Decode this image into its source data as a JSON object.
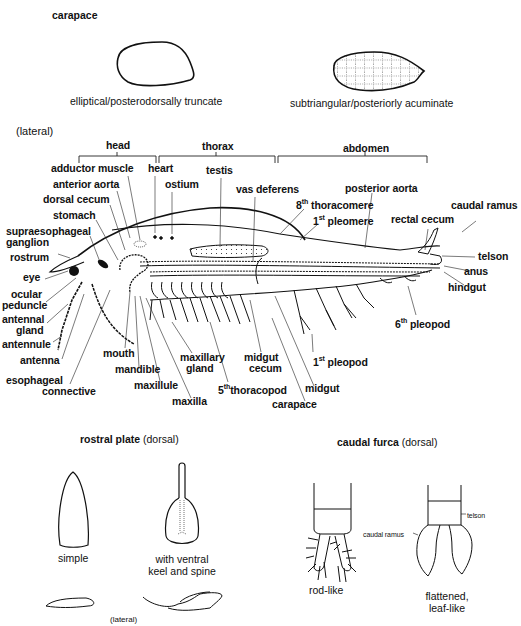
{
  "carapace": {
    "title": "carapace",
    "forms": [
      {
        "caption": "elliptical/posterodorsally truncate"
      },
      {
        "caption": "subtriangular/posteriorly acuminate"
      }
    ]
  },
  "lateral_view": {
    "title": "(lateral)",
    "regions": [
      {
        "label": "head"
      },
      {
        "label": "thorax"
      },
      {
        "label": "abdomen"
      }
    ],
    "labels": {
      "adductor_muscle": "adductor muscle",
      "heart": "heart",
      "testis": "testis",
      "anterior_aorta": "anterior aorta",
      "ostium": "ostium",
      "vas_deferens": "vas deferens",
      "dorsal_cecum": "dorsal cecum",
      "stomach": "stomach",
      "supraesophageal_ganglion_1": "supraesophageal",
      "supraesophageal_ganglion_2": "ganglion",
      "rostrum": "rostrum",
      "eye": "eye",
      "ocular_peduncle_1": "ocular",
      "ocular_peduncle_2": "peduncle",
      "antennal_gland_1": "antennal",
      "antennal_gland_2": "gland",
      "antennule": "antennule",
      "antenna": "antenna",
      "esophageal_connective_1": "esophageal",
      "esophageal_connective_2": "connective",
      "mouth": "mouth",
      "mandible": "mandible",
      "maxillule": "maxillule",
      "maxilla": "maxilla",
      "maxillary_gland_1": "maxillary",
      "maxillary_gland_2": "gland",
      "thoracopod_5_num": "5",
      "thoracopod_5_sup": "th",
      "thoracopod_5_text": "thoracopod",
      "midgut_cecum_1": "midgut",
      "midgut_cecum_2": "cecum",
      "carapace": "carapace",
      "midgut": "midgut",
      "pleopod_1_num": "1",
      "pleopod_1_sup": "st",
      "pleopod_1_text": " pleopod",
      "pleopod_6_num": "6",
      "pleopod_6_sup": "th",
      "pleopod_6_text": " pleopod",
      "hindgut": "hindgut",
      "anus": "anus",
      "telson": "telson",
      "caudal_ramus": "caudal ramus",
      "rectal_cecum": "rectal cecum",
      "posterior_aorta": "posterior aorta",
      "thoracomere_8_num": "8",
      "thoracomere_8_sup": "th",
      "thoracomere_8_text": " thoracomere",
      "pleomere_1_num": "1",
      "pleomere_1_sup": "st",
      "pleomere_1_text": " pleomere"
    }
  },
  "rostral_plate": {
    "title": "rostral plate",
    "view": "(dorsal)",
    "forms": [
      {
        "caption": "simple"
      },
      {
        "caption_1": "with ventral",
        "caption_2": "keel and spine"
      }
    ],
    "lateral_label": "(lateral)"
  },
  "caudal_furca": {
    "title": "caudal furca",
    "view": "(dorsal)",
    "forms": [
      {
        "caption": "rod-like"
      },
      {
        "caption_1": "flattened,",
        "caption_2": "leaf-like"
      }
    ],
    "labels": {
      "telson": "telson",
      "caudal_ramus": "caudal ramus"
    }
  }
}
